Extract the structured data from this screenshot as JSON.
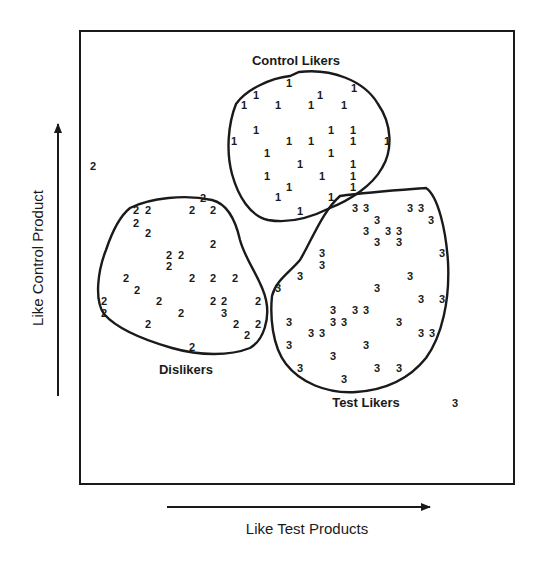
{
  "diagram": {
    "type": "cluster-map",
    "x_axis_label": "Like Test Products",
    "y_axis_label": "Like Control Product",
    "clusters": [
      {
        "id": 1,
        "label": "Control Likers",
        "symbol": "1"
      },
      {
        "id": 2,
        "label": "Dislikers",
        "symbol": "2"
      },
      {
        "id": 3,
        "label": "Test Likers",
        "symbol": "3"
      }
    ],
    "outliers": [
      {
        "symbol": "2",
        "x": 93,
        "y": 166
      },
      {
        "symbol": "3",
        "x": 455,
        "y": 403
      }
    ]
  },
  "points": {
    "c1": [
      [
        289,
        83
      ],
      [
        256,
        95
      ],
      [
        320,
        95
      ],
      [
        354,
        88
      ],
      [
        244,
        105
      ],
      [
        278,
        105
      ],
      [
        311,
        105
      ],
      [
        344,
        105
      ],
      [
        256,
        130
      ],
      [
        331,
        130
      ],
      [
        353,
        130
      ],
      [
        234,
        141
      ],
      [
        289,
        141
      ],
      [
        311,
        141
      ],
      [
        353,
        141
      ],
      [
        387,
        141
      ],
      [
        267,
        153
      ],
      [
        331,
        153
      ],
      [
        300,
        164
      ],
      [
        353,
        164
      ],
      [
        267,
        176
      ],
      [
        322,
        176
      ],
      [
        353,
        176
      ],
      [
        289,
        187
      ],
      [
        353,
        187
      ],
      [
        278,
        197
      ],
      [
        331,
        197
      ],
      [
        300,
        211
      ]
    ],
    "c2": [
      [
        203,
        198
      ],
      [
        136,
        210
      ],
      [
        148,
        210
      ],
      [
        192,
        210
      ],
      [
        213,
        210
      ],
      [
        136,
        223
      ],
      [
        148,
        233
      ],
      [
        213,
        244
      ],
      [
        169,
        255
      ],
      [
        181,
        255
      ],
      [
        169,
        266
      ],
      [
        126,
        278
      ],
      [
        192,
        278
      ],
      [
        213,
        278
      ],
      [
        235,
        278
      ],
      [
        137,
        290
      ],
      [
        104,
        301
      ],
      [
        159,
        301
      ],
      [
        213,
        301
      ],
      [
        224,
        301
      ],
      [
        258,
        301
      ],
      [
        104,
        313
      ],
      [
        181,
        313
      ],
      [
        224,
        313
      ],
      [
        148,
        324
      ],
      [
        236,
        324
      ],
      [
        258,
        324
      ],
      [
        247,
        335
      ],
      [
        192,
        347
      ]
    ],
    "c2_symbols_override": {
      "23": "3"
    },
    "c3": [
      [
        355,
        208
      ],
      [
        366,
        208
      ],
      [
        410,
        208
      ],
      [
        421,
        208
      ],
      [
        377,
        220
      ],
      [
        431,
        220
      ],
      [
        366,
        231
      ],
      [
        388,
        231
      ],
      [
        399,
        231
      ],
      [
        377,
        242
      ],
      [
        399,
        242
      ],
      [
        322,
        253
      ],
      [
        442,
        253
      ],
      [
        322,
        265
      ],
      [
        300,
        276
      ],
      [
        410,
        276
      ],
      [
        278,
        288
      ],
      [
        377,
        288
      ],
      [
        421,
        299
      ],
      [
        442,
        299
      ],
      [
        333,
        310
      ],
      [
        355,
        310
      ],
      [
        366,
        310
      ],
      [
        289,
        322
      ],
      [
        333,
        322
      ],
      [
        344,
        322
      ],
      [
        399,
        322
      ],
      [
        311,
        333
      ],
      [
        322,
        333
      ],
      [
        421,
        333
      ],
      [
        432,
        333
      ],
      [
        289,
        345
      ],
      [
        366,
        345
      ],
      [
        333,
        356
      ],
      [
        300,
        368
      ],
      [
        377,
        368
      ],
      [
        399,
        368
      ],
      [
        344,
        379
      ]
    ]
  },
  "labels": {
    "c1": {
      "text": "Control Likers",
      "x": 296,
      "y": 60
    },
    "c2": {
      "text": "Dislikers",
      "x": 186,
      "y": 369
    },
    "c3": {
      "text": "Test Likers",
      "x": 366,
      "y": 402
    }
  }
}
